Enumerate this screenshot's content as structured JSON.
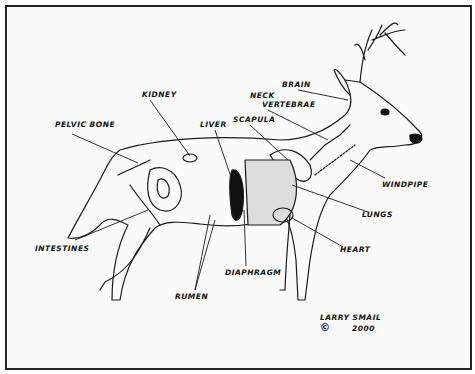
{
  "labels": {
    "pelvic_bone": "PELVIC BONE",
    "kidney": "KIDNEY",
    "liver": "LIVER",
    "scapula": "SCAPULA",
    "neck_vertebrae_1": "NECK",
    "neck_vertebrae_2": "VERTEBRAE",
    "brain": "BRAIN",
    "windpipe": "WINDPIPE",
    "lungs": "LUNGS",
    "heart": "HEART",
    "diaphragm": "DIAPHRAGM",
    "rumen": "RUMEN",
    "intestines": "INTESTINES"
  },
  "signature": {
    "artist": "LARRY SMAIL",
    "copyright": "©",
    "year": "2000"
  }
}
